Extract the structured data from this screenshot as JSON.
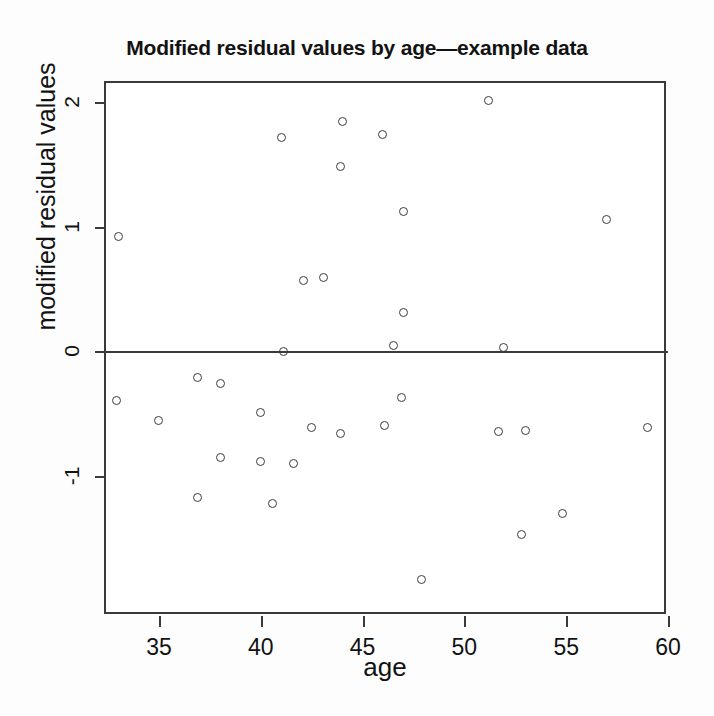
{
  "chart_data": {
    "type": "scatter",
    "title": "Modified residual values by age—example data",
    "xlabel": "age",
    "ylabel": "modified residual values",
    "xlim": [
      32.4,
      60.0
    ],
    "ylim": [
      -2.12,
      2.15
    ],
    "xticks": [
      35,
      40,
      45,
      50,
      55,
      60
    ],
    "yticks": [
      -1,
      0,
      1,
      2
    ],
    "xtick_labels": [
      "35",
      "40",
      "45",
      "50",
      "55",
      "60"
    ],
    "ytick_labels": [
      "-1",
      "0",
      "1",
      "2"
    ],
    "grid": false,
    "legend": null,
    "annotations": [
      {
        "kind": "reference-line",
        "axis": "y",
        "value": 0,
        "style": "solid"
      }
    ],
    "marker": "open-circle",
    "marker_color": "#3c3c3c",
    "series": [
      {
        "name": "modified residuals",
        "points": [
          {
            "x": 33.0,
            "y": 0.92
          },
          {
            "x": 32.9,
            "y": -0.39
          },
          {
            "x": 35.0,
            "y": -0.55
          },
          {
            "x": 36.9,
            "y": -0.21
          },
          {
            "x": 36.9,
            "y": -1.17
          },
          {
            "x": 38.0,
            "y": -0.26
          },
          {
            "x": 38.0,
            "y": -0.85
          },
          {
            "x": 40.0,
            "y": -0.49
          },
          {
            "x": 40.0,
            "y": -0.88
          },
          {
            "x": 40.6,
            "y": -1.22
          },
          {
            "x": 41.1,
            "y": 0.0
          },
          {
            "x": 41.0,
            "y": 1.71
          },
          {
            "x": 41.6,
            "y": -0.9
          },
          {
            "x": 42.1,
            "y": 0.57
          },
          {
            "x": 42.5,
            "y": -0.61
          },
          {
            "x": 43.1,
            "y": 0.59
          },
          {
            "x": 43.9,
            "y": 1.48
          },
          {
            "x": 43.9,
            "y": -0.66
          },
          {
            "x": 44.0,
            "y": 1.84
          },
          {
            "x": 46.0,
            "y": 1.74
          },
          {
            "x": 46.1,
            "y": -0.59
          },
          {
            "x": 46.5,
            "y": 0.05
          },
          {
            "x": 46.9,
            "y": -0.37
          },
          {
            "x": 47.0,
            "y": 1.12
          },
          {
            "x": 47.0,
            "y": 0.31
          },
          {
            "x": 47.9,
            "y": -1.83
          },
          {
            "x": 51.2,
            "y": 2.01
          },
          {
            "x": 51.7,
            "y": -0.64
          },
          {
            "x": 51.9,
            "y": 0.03
          },
          {
            "x": 52.8,
            "y": -1.47
          },
          {
            "x": 53.0,
            "y": -0.63
          },
          {
            "x": 54.8,
            "y": -1.3
          },
          {
            "x": 57.0,
            "y": 1.06
          },
          {
            "x": 59.0,
            "y": -0.61
          }
        ]
      }
    ]
  }
}
